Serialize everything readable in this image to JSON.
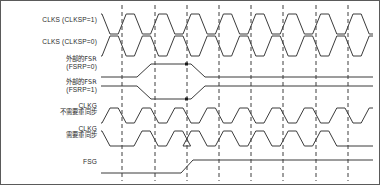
{
  "diagram": {
    "colors": {
      "signal": "#3b3b3b",
      "grid": "#3f3f3f",
      "border": "#5a5a5a",
      "text": "#2b2b2b",
      "background": "#ffffff"
    },
    "grid": {
      "style": "dashed",
      "count": 9,
      "x_positions": [
        121,
        154,
        186,
        218,
        250,
        282,
        315,
        347,
        121
      ],
      "y_top": 4,
      "y_bottom": 180
    },
    "signals": [
      {
        "id": "clks-clksp1",
        "label_lines": [
          "CLKS (CLKSP=1)"
        ],
        "label_scripts": [
          "en"
        ],
        "label_y": 20,
        "baseline_y": 33,
        "top_y": 13,
        "type": "clock",
        "polarity": "high-first",
        "description": "Source clock CLKS sampled on CLKSP=1"
      },
      {
        "id": "clks-clksp0",
        "label_lines": [
          "CLKS (CLKSP=0)"
        ],
        "label_scripts": [
          "en"
        ],
        "label_y": 42,
        "baseline_y": 55,
        "top_y": 35,
        "type": "clock",
        "polarity": "low-first",
        "description": "Source clock CLKS sampled on CLKSP=0"
      },
      {
        "id": "fsr-fsrp0",
        "label_lines": [
          "外部的FSR",
          "(FSRP=0)"
        ],
        "label_scripts": [
          "cn",
          "en"
        ],
        "label_y": 60,
        "baseline_y": 76,
        "top_y": 63,
        "type": "pulse",
        "active": "high",
        "description": "External FSR with FSRP=0"
      },
      {
        "id": "fsr-fsrp1",
        "label_lines": [
          "外部的FSR",
          "(FSRP=1)"
        ],
        "label_scripts": [
          "cn",
          "en"
        ],
        "label_y": 82,
        "baseline_y": 85,
        "top_y": 98,
        "type": "pulse",
        "active": "low",
        "description": "External FSR with FSRP=1"
      },
      {
        "id": "clkg-no-resync",
        "label_lines": [
          "CLKG",
          "不需要重同步"
        ],
        "label_scripts": [
          "en",
          "cn"
        ],
        "label_y": 104,
        "baseline_y": 122,
        "top_y": 107,
        "type": "clock",
        "description": "CLKG that does not require resynchronization"
      },
      {
        "id": "clkg-resync",
        "label_lines": [
          "CLKG",
          "需要重同步"
        ],
        "label_scripts": [
          "en",
          "cn"
        ],
        "label_y": 127,
        "baseline_y": 145,
        "top_y": 130,
        "type": "clock",
        "description": "CLKG that requires resynchronization"
      },
      {
        "id": "fsg",
        "label_lines": [
          "FSG"
        ],
        "label_scripts": [
          "en"
        ],
        "label_y": 162,
        "baseline_y": 172,
        "top_y": 159,
        "type": "pulse",
        "active": "high",
        "description": "Generated frame sync FSG"
      }
    ]
  }
}
